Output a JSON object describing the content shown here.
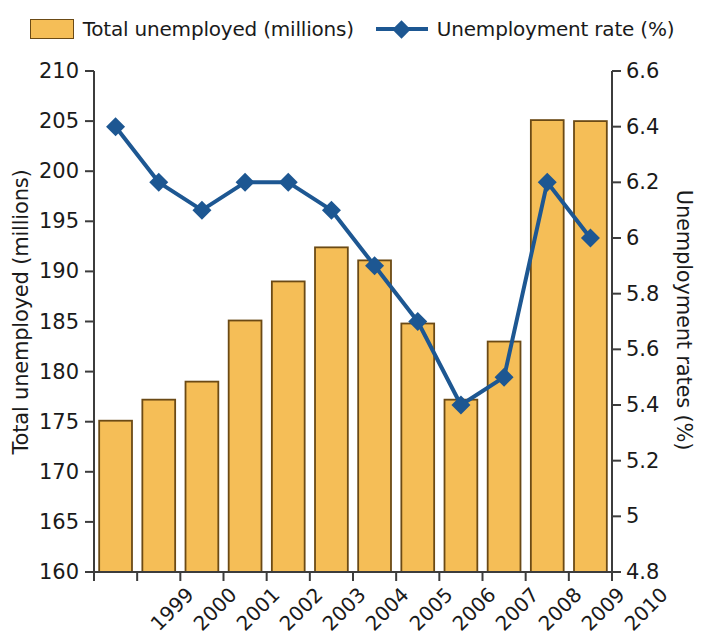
{
  "legend": {
    "entries": [
      {
        "label": "Total unemployed (millions)",
        "type": "bar",
        "color": "#f5be57"
      },
      {
        "label": "Unemployment rate (%)",
        "type": "line-marker",
        "color": "#1d5792"
      }
    ]
  },
  "axes": {
    "left_title": "Total unemployed (millions)",
    "right_title": "Unemployment rates (%)",
    "left_ticks": [
      "160",
      "165",
      "170",
      "175",
      "180",
      "185",
      "190",
      "195",
      "200",
      "205",
      "210"
    ],
    "right_ticks": [
      "4.8",
      "5",
      "5.2",
      "5.4",
      "5.6",
      "5.8",
      "6",
      "6.2",
      "6.4",
      "6.6"
    ]
  },
  "colors": {
    "bar_fill": "#f5be57",
    "bar_stroke": "#6b4a15",
    "line": "#1d5792",
    "axis": "#3c3c3c",
    "text": "#1a1a1a"
  },
  "chart_data": {
    "type": "bar",
    "title": "",
    "subtitle": "",
    "xlabel": "",
    "ylabel": "Total unemployed (millions)",
    "y2label": "Unemployment rates (%)",
    "categories": [
      "1999",
      "2000",
      "2001",
      "2002",
      "2003",
      "2004",
      "2005",
      "2006",
      "2007",
      "2008",
      "2009",
      "2010"
    ],
    "ylim": [
      160,
      210
    ],
    "y2lim": [
      4.8,
      6.6
    ],
    "ytick_step": 5,
    "y2tick_step": 0.2,
    "grid": false,
    "legend_position": "top",
    "series": [
      {
        "name": "Total unemployed (millions)",
        "type": "bar",
        "axis": "left",
        "color": "#f5be57",
        "values": [
          175.1,
          177.2,
          179.0,
          185.1,
          189.0,
          192.4,
          191.1,
          184.8,
          177.2,
          183.0,
          205.1,
          205.0
        ]
      },
      {
        "name": "Unemployment rate (%)",
        "type": "line",
        "axis": "right",
        "color": "#1d5792",
        "marker": "diamond",
        "values": [
          6.4,
          6.2,
          6.1,
          6.2,
          6.2,
          6.1,
          5.9,
          5.7,
          5.4,
          5.5,
          6.2,
          6.0
        ]
      }
    ]
  }
}
